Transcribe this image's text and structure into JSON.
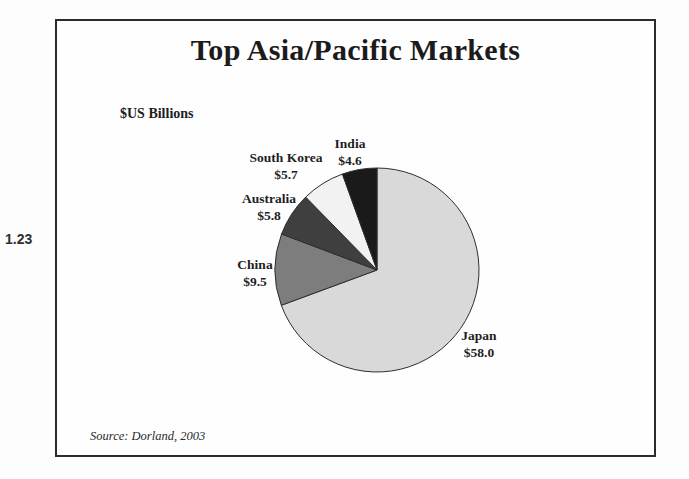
{
  "figure_number": "1.23",
  "chart_data": {
    "type": "pie",
    "title": "Top Asia/Pacific Markets",
    "unit_label": "$US Billions",
    "source": "Source: Dorland, 2003",
    "total": 83.6,
    "start_angle_deg": 0,
    "direction": "clockwise",
    "outline_color": "#2e2e2e",
    "slices": [
      {
        "label": "Japan",
        "value": 58.0,
        "value_label": "$58.0",
        "color": "#d9d9d9"
      },
      {
        "label": "China",
        "value": 9.5,
        "value_label": "$9.5",
        "color": "#7d7d7d"
      },
      {
        "label": "Australia",
        "value": 5.8,
        "value_label": "$5.8",
        "color": "#3f3f3f"
      },
      {
        "label": "South Korea",
        "value": 5.7,
        "value_label": "$5.7",
        "color": "#f2f2f2"
      },
      {
        "label": "India",
        "value": 4.6,
        "value_label": "$4.6",
        "color": "#1a1a1a"
      }
    ]
  }
}
